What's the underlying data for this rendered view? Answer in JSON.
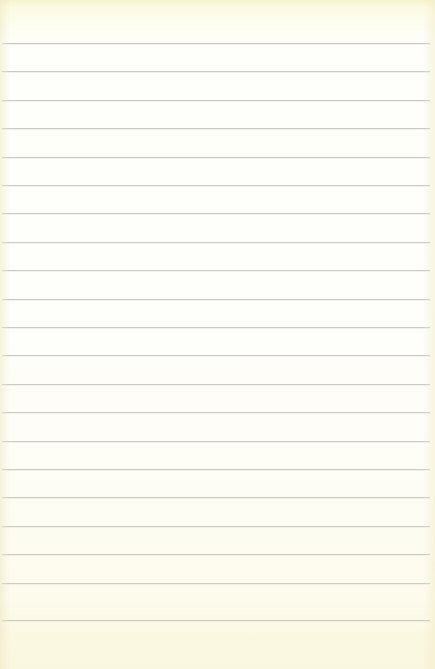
{
  "document": {
    "kind": "ruled-notepaper",
    "title": "Blank lined notepaper sheet",
    "width_px": 435,
    "height_px": 669,
    "content_text": "",
    "is_blank": true
  },
  "paper": {
    "base_color": "#fefefb",
    "top_tint_color": "#fbfbdd",
    "bottom_tint_color": "#faf7df",
    "edge_tint_color": "#f0ead0"
  },
  "rules": {
    "line_color": "#c9c9c2",
    "line_count": 21,
    "line_thickness_px": 1,
    "line_spacing_px": 28.4,
    "first_line_y_px": 43,
    "last_line_y_px": 620,
    "line_left_x_px": 2,
    "line_right_x_px": 430,
    "header_margin_px": 43,
    "footer_margin_px": 49,
    "positions_y_px": [
      43,
      71.4,
      99.8,
      128.2,
      156.6,
      185,
      213.4,
      241.8,
      270.2,
      298.6,
      327,
      355.4,
      383.8,
      412.2,
      440.6,
      469,
      497.4,
      525.8,
      554.2,
      582.6,
      620
    ]
  }
}
